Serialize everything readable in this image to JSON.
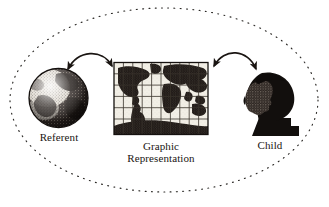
{
  "figure": {
    "type": "conceptual-triadic-diagram",
    "background_color": "#ffffff",
    "ink_color": "#1a1512",
    "boundary": {
      "shape": "ellipse",
      "style": "dotted",
      "name": "representational-system-boundary"
    },
    "nodes": [
      {
        "id": "referent",
        "label": "Referent",
        "icon": "globe-earth-icon",
        "position": "left"
      },
      {
        "id": "graphic-representation",
        "label_line_1": "Graphic",
        "label_line_2": "Representation",
        "label": "Graphic Representation",
        "icon": "world-map-grid-icon",
        "position": "center"
      },
      {
        "id": "child",
        "label": "Child",
        "icon": "child-head-silhouette-icon",
        "position": "right"
      }
    ],
    "connectors": [
      {
        "id": "referent-to-map",
        "from": "referent",
        "to": "graphic-representation",
        "style": "curved",
        "arrowheads": "both"
      },
      {
        "id": "map-to-child",
        "from": "graphic-representation",
        "to": "child",
        "style": "curved",
        "arrowheads": "both"
      }
    ]
  }
}
